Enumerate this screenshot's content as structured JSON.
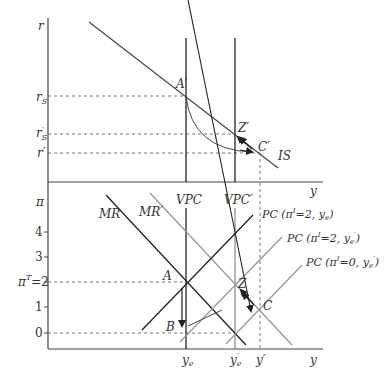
{
  "diagram": {
    "type": "IS-PC-MR economic diagram",
    "colors": {
      "dark": "#333333",
      "light": "#999999",
      "dashed": "#555555"
    },
    "top_panel": {
      "y_axis_label": "r",
      "x_axis_label": "y",
      "rate_labels": {
        "rS": "r",
        "rS_sub": "S",
        "rSp": "r",
        "rSp_sub": "S",
        "rSp_prime": "′",
        "rp": "r′"
      },
      "points": {
        "Ap": "A′",
        "Zp": "Z′",
        "Cp": "C′"
      },
      "curve_label": "IS"
    },
    "bottom_panel": {
      "y_axis_label": "π",
      "x_axis_label": "y",
      "ticks": [
        "4",
        "3",
        "2",
        "1",
        "0"
      ],
      "target_label": "π",
      "target_sup": "T",
      "target_eq": "=2",
      "lines": {
        "MR": "MR",
        "MRp": "MR′",
        "VPC": "VPC",
        "VPCp": "VPC′",
        "PC1": "PC (π",
        "PC1_sup": "I",
        "PC1_tail": "=2, y",
        "PC1_sub": "e",
        "PC1_close": ")",
        "PC2": "PC (π",
        "PC2_sup": "I",
        "PC2_tail": "=2, y",
        "PC2_sub": "e",
        "PC2_prime": "′",
        "PC2_close": ")",
        "PC3": "PC (π",
        "PC3_sup": "I",
        "PC3_tail": "=0, y",
        "PC3_sub": "e",
        "PC3_prime": "′",
        "PC3_close": ")"
      },
      "points": {
        "A": "A",
        "B": "B",
        "Z": "Z",
        "C": "C"
      },
      "x_ticks": {
        "ye": "y",
        "ye_sub": "e",
        "yep": "y",
        "yep_sub": "e",
        "yep_prime": "′",
        "yp": "y′"
      }
    }
  }
}
